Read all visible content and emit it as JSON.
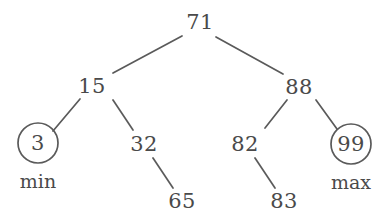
{
  "diagram": {
    "stroke_color": "#5a5a5a",
    "text_color": "#4a4a4a",
    "background_color": "#ffffff",
    "nodes": [
      {
        "id": "n71",
        "label": "71",
        "x": 200,
        "y": 22,
        "circled": false
      },
      {
        "id": "n15",
        "label": "15",
        "x": 92,
        "y": 86,
        "circled": false
      },
      {
        "id": "n88",
        "label": "88",
        "x": 299,
        "y": 87,
        "circled": false
      },
      {
        "id": "n3",
        "label": "3",
        "x": 38,
        "y": 143,
        "circled": true,
        "radius": 20
      },
      {
        "id": "n32",
        "label": "32",
        "x": 144,
        "y": 144,
        "circled": false
      },
      {
        "id": "n82",
        "label": "82",
        "x": 245,
        "y": 144,
        "circled": false
      },
      {
        "id": "n99",
        "label": "99",
        "x": 351,
        "y": 144,
        "circled": true,
        "radius": 20
      },
      {
        "id": "n65",
        "label": "65",
        "x": 182,
        "y": 201,
        "circled": false
      },
      {
        "id": "n83",
        "label": "83",
        "x": 284,
        "y": 201,
        "circled": false
      }
    ],
    "edges": [
      {
        "from": "n71",
        "to": "n15",
        "x1": 182,
        "y1": 36,
        "x2": 113,
        "y2": 73
      },
      {
        "from": "n71",
        "to": "n88",
        "x1": 216,
        "y1": 37,
        "x2": 283,
        "y2": 74
      },
      {
        "from": "n15",
        "to": "n3",
        "x1": 80,
        "y1": 99,
        "x2": 53,
        "y2": 131
      },
      {
        "from": "n15",
        "to": "n32",
        "x1": 113,
        "y1": 100,
        "x2": 133,
        "y2": 130
      },
      {
        "from": "n88",
        "to": "n82",
        "x1": 287,
        "y1": 100,
        "x2": 265,
        "y2": 128
      },
      {
        "from": "n88",
        "to": "n99",
        "x1": 316,
        "y1": 100,
        "x2": 337,
        "y2": 129
      },
      {
        "from": "n32",
        "to": "n65",
        "x1": 153,
        "y1": 158,
        "x2": 173,
        "y2": 188
      },
      {
        "from": "n82",
        "to": "n83",
        "x1": 255,
        "y1": 158,
        "x2": 275,
        "y2": 188
      }
    ],
    "annotations": [
      {
        "id": "a-min",
        "label": "min",
        "for": "n3",
        "x": 38,
        "y": 181
      },
      {
        "id": "a-max",
        "label": "max",
        "for": "n99",
        "x": 351,
        "y": 182
      }
    ]
  }
}
